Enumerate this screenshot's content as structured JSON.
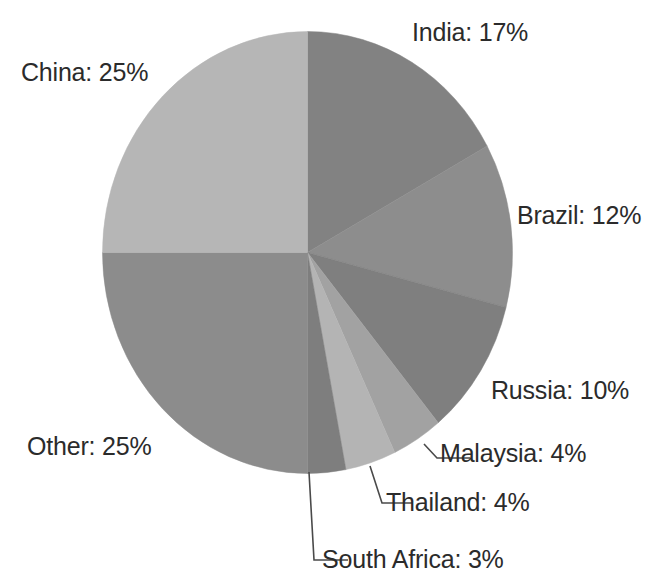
{
  "chart_data": {
    "type": "pie",
    "title": "",
    "xlabel": "",
    "ylabel": "",
    "legend_position": "none",
    "grid": false,
    "start_angle_deg": 0,
    "direction": "clockwise",
    "categories": [
      "India",
      "Brazil",
      "Russia",
      "Malaysia",
      "Thailand",
      "South Africa",
      "Other",
      "China"
    ],
    "values": [
      17,
      12,
      10,
      4,
      4,
      3,
      25,
      25
    ],
    "units": "percent",
    "labels": [
      "India: 17%",
      "Brazil: 12%",
      "Russia: 10%",
      "Malaysia: 4%",
      "Thailand: 4%",
      "South Africa: 3%",
      "Other: 25%",
      "China: 25%"
    ],
    "slice_colors": [
      "#828282",
      "#8d8d8d",
      "#7f7f7f",
      "#a2a2a2",
      "#b4b4b4",
      "#7e7e7e",
      "#8c8c8c",
      "#b6b6b6"
    ],
    "slices": [
      {
        "name": "India",
        "label": "India: 17%",
        "value": 17,
        "color": "#828282",
        "leader": false
      },
      {
        "name": "Brazil",
        "label": "Brazil: 12%",
        "value": 12,
        "color": "#8d8d8d",
        "leader": false
      },
      {
        "name": "Russia",
        "label": "Russia: 10%",
        "value": 10,
        "color": "#7f7f7f",
        "leader": false
      },
      {
        "name": "Malaysia",
        "label": "Malaysia: 4%",
        "value": 4,
        "color": "#a2a2a2",
        "leader": true
      },
      {
        "name": "Thailand",
        "label": "Thailand: 4%",
        "value": 4,
        "color": "#b4b4b4",
        "leader": true
      },
      {
        "name": "South Africa",
        "label": "South Africa: 3%",
        "value": 3,
        "color": "#7e7e7e",
        "leader": true
      },
      {
        "name": "Other",
        "label": "Other: 25%",
        "value": 25,
        "color": "#8c8c8c",
        "leader": false
      },
      {
        "name": "China",
        "label": "China: 25%",
        "value": 25,
        "color": "#b6b6b6",
        "leader": false
      }
    ]
  },
  "labels": {
    "india": "India: 17%",
    "china": "China: 25%",
    "brazil": "Brazil: 12%",
    "russia": "Russia: 10%",
    "other": "Other: 25%",
    "malaysia": "Malaysia: 4%",
    "thailand": "Thailand: 4%",
    "south_africa": "South Africa: 3%"
  },
  "colors": {
    "background": "#ffffff",
    "text": "#2b2b2b",
    "leader_line": "#4a4a4a"
  }
}
